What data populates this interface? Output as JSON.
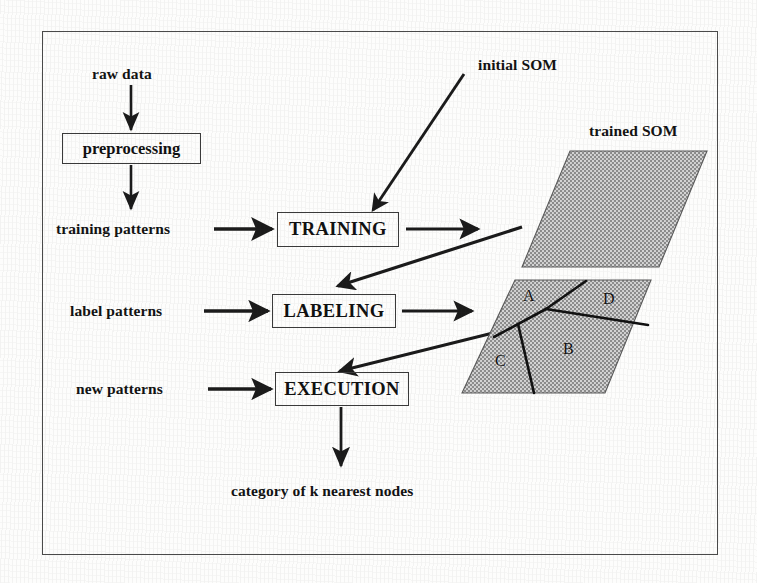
{
  "figure": {
    "kind": "flow-diagram",
    "topic": "Self-Organizing Map workflow"
  },
  "inputs": {
    "raw_data": "raw data",
    "training_patterns": "training patterns",
    "label_patterns": "label patterns",
    "new_patterns": "new patterns"
  },
  "boxes": {
    "preprocessing": "preprocessing",
    "training": "TRAINING",
    "labeling": "LABELING",
    "execution": "EXECUTION"
  },
  "maps": {
    "initial_som": "initial SOM",
    "trained_som": "trained SOM",
    "regions": [
      "A",
      "D",
      "C",
      "B"
    ]
  },
  "output": {
    "result": "category of k nearest nodes"
  },
  "colors": {
    "ink": "#121212",
    "frame": "#4a4a4a",
    "map_fill": "#8f8f8f",
    "map_stroke": "#4a4a4a",
    "arrow": "#1a1a1a",
    "paper": "#fdfdfc"
  }
}
